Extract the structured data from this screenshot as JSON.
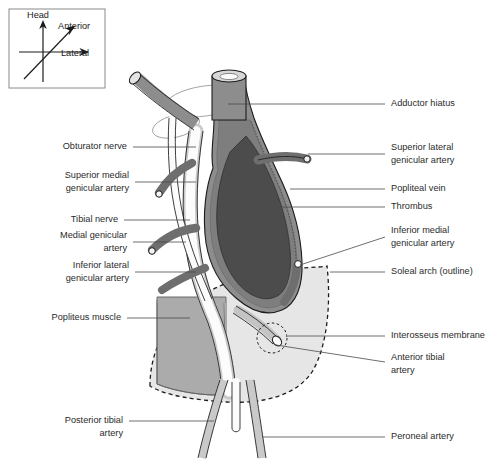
{
  "figure": {
    "background_color": "#ffffff"
  },
  "orientation_inset": {
    "name": "orientation-key",
    "axes": [
      {
        "id": "head",
        "label": "Head",
        "direction": "up"
      },
      {
        "id": "anterior",
        "label": "Anterior",
        "direction": "up-right-diagonal"
      },
      {
        "id": "lateral",
        "label": "Lateral",
        "direction": "right"
      }
    ]
  },
  "labels_left": [
    {
      "id": "obturator-nerve",
      "text": "Obturator nerve",
      "lines": [
        "Obturator nerve"
      ]
    },
    {
      "id": "superior-medial-genicular-artery",
      "text": "Superior medial genicular artery",
      "lines": [
        "Superior medial",
        "genicular artery"
      ]
    },
    {
      "id": "tibial-nerve",
      "text": "Tibial nerve",
      "lines": [
        "Tibial nerve"
      ]
    },
    {
      "id": "medial-genicular-artery",
      "text": "Medial genicular artery",
      "lines": [
        "Medial genicular",
        "artery"
      ]
    },
    {
      "id": "inferior-lateral-genicular-artery",
      "text": "Inferior lateral genicular artery",
      "lines": [
        "Inferior lateral",
        "genicular artery"
      ]
    },
    {
      "id": "popliteus-muscle",
      "text": "Popliteus muscle",
      "lines": [
        "Popliteus muscle"
      ]
    },
    {
      "id": "posterior-tibial-artery",
      "text": "Posterior tibial artery",
      "lines": [
        "Posterior tibial",
        "artery"
      ]
    }
  ],
  "labels_right": [
    {
      "id": "adductor-hiatus",
      "text": "Adductor hiatus",
      "lines": [
        "Adductor hiatus"
      ]
    },
    {
      "id": "superior-lateral-genicular-artery",
      "text": "Superior lateral genicular artery",
      "lines": [
        "Superior lateral",
        "genicular artery"
      ]
    },
    {
      "id": "popliteal-vein",
      "text": "Popliteal vein",
      "lines": [
        "Popliteal vein"
      ]
    },
    {
      "id": "thrombus",
      "text": "Thrombus",
      "lines": [
        "Thrombus"
      ]
    },
    {
      "id": "inferior-medial-genicular-artery",
      "text": "Inferior medial genicular artery",
      "lines": [
        "Inferior medial",
        "genicular artery"
      ]
    },
    {
      "id": "soleal-arch-outline",
      "text": "Soleal arch (outline)",
      "lines": [
        "Soleal arch (outline)"
      ]
    },
    {
      "id": "interosseus-membrane",
      "text": "Interosseus membrane",
      "lines": [
        "Interosseus membrane"
      ]
    },
    {
      "id": "anterior-tibial-artery",
      "text": "Anterior tibial artery",
      "lines": [
        "Anterior tibial",
        "artery"
      ]
    },
    {
      "id": "peroneal-artery",
      "text": "Peroneal artery",
      "lines": [
        "Peroneal artery"
      ]
    }
  ],
  "colors": {
    "thrombus_fill": "#4c4c4c",
    "vessel_wall_gray": "#8f8f8f",
    "artery_dark_gray": "#6b6b6b",
    "muscle_fill": "#a9a9a9",
    "soleal_arch_fill": "#e2e2e2",
    "vessel_light": "#fdfdfd",
    "outline_stroke": "#1c1c1c",
    "leader_stroke": "#4a4a4a",
    "text_color": "#2b2b2b"
  }
}
